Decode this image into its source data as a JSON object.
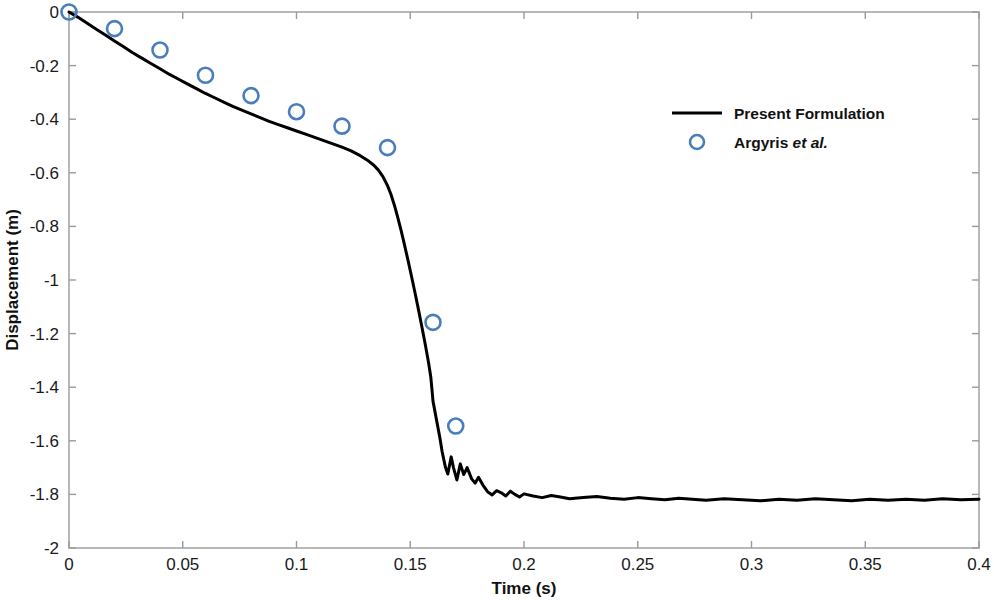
{
  "chart_data": {
    "type": "line",
    "title": "",
    "xlabel": "Time (s)",
    "ylabel": "Displacement (m)",
    "xlim": [
      0,
      0.4
    ],
    "ylim": [
      -2,
      0
    ],
    "grid": false,
    "legend_position": "upper right",
    "xticks": [
      0,
      0.05,
      0.1,
      0.15,
      0.2,
      0.25,
      0.3,
      0.35,
      0.4
    ],
    "xticklabels": [
      "0",
      "0.05",
      "0.1",
      "0.15",
      "0.2",
      "0.25",
      "0.3",
      "0.35",
      "0.4"
    ],
    "yticks": [
      0,
      -0.2,
      -0.4,
      -0.6,
      -0.8,
      -1,
      -1.2,
      -1.4,
      -1.6,
      -1.8,
      -2
    ],
    "yticklabels": [
      "0",
      "-0.2",
      "-0.4",
      "-0.6",
      "-0.8",
      "-1",
      "-1.2",
      "-1.4",
      "-1.6",
      "-1.8",
      "-2"
    ],
    "series": [
      {
        "name": "Present Formulation",
        "style": "line",
        "color": "#000000",
        "linewidth": 3,
        "x": [
          0,
          0.004,
          0.008,
          0.012,
          0.016,
          0.02,
          0.024,
          0.028,
          0.032,
          0.036,
          0.04,
          0.044,
          0.048,
          0.052,
          0.056,
          0.06,
          0.064,
          0.068,
          0.072,
          0.076,
          0.08,
          0.084,
          0.088,
          0.092,
          0.096,
          0.1,
          0.104,
          0.108,
          0.112,
          0.116,
          0.12,
          0.124,
          0.128,
          0.131,
          0.134,
          0.136,
          0.138,
          0.14,
          0.1415,
          0.143,
          0.1445,
          0.146,
          0.1475,
          0.149,
          0.1505,
          0.152,
          0.1535,
          0.155,
          0.1565,
          0.158,
          0.159,
          0.1595,
          0.16,
          0.1615,
          0.163,
          0.164,
          0.1655,
          0.1665,
          0.168,
          0.169,
          0.1705,
          0.172,
          0.1735,
          0.175,
          0.177,
          0.1785,
          0.18,
          0.182,
          0.184,
          0.186,
          0.188,
          0.19,
          0.192,
          0.194,
          0.196,
          0.198,
          0.2,
          0.204,
          0.208,
          0.212,
          0.216,
          0.22,
          0.226,
          0.232,
          0.238,
          0.244,
          0.25,
          0.256,
          0.262,
          0.268,
          0.274,
          0.28,
          0.288,
          0.296,
          0.304,
          0.312,
          0.32,
          0.328,
          0.336,
          0.344,
          0.352,
          0.36,
          0.368,
          0.376,
          0.384,
          0.392,
          0.4
        ],
        "y": [
          0,
          -0.02,
          -0.042,
          -0.064,
          -0.086,
          -0.108,
          -0.13,
          -0.152,
          -0.172,
          -0.192,
          -0.212,
          -0.232,
          -0.25,
          -0.268,
          -0.286,
          -0.304,
          -0.32,
          -0.336,
          -0.352,
          -0.366,
          -0.38,
          -0.394,
          -0.408,
          -0.42,
          -0.432,
          -0.444,
          -0.456,
          -0.468,
          -0.48,
          -0.492,
          -0.504,
          -0.518,
          -0.536,
          -0.552,
          -0.572,
          -0.59,
          -0.614,
          -0.648,
          -0.68,
          -0.72,
          -0.766,
          -0.816,
          -0.87,
          -0.926,
          -0.984,
          -1.044,
          -1.106,
          -1.17,
          -1.236,
          -1.306,
          -1.36,
          -1.404,
          -1.452,
          -1.52,
          -1.588,
          -1.64,
          -1.7,
          -1.724,
          -1.66,
          -1.7,
          -1.746,
          -1.686,
          -1.726,
          -1.7,
          -1.742,
          -1.758,
          -1.736,
          -1.766,
          -1.79,
          -1.802,
          -1.786,
          -1.794,
          -1.806,
          -1.788,
          -1.8,
          -1.81,
          -1.798,
          -1.806,
          -1.812,
          -1.804,
          -1.81,
          -1.816,
          -1.812,
          -1.808,
          -1.814,
          -1.818,
          -1.812,
          -1.816,
          -1.82,
          -1.814,
          -1.818,
          -1.822,
          -1.816,
          -1.82,
          -1.824,
          -1.818,
          -1.822,
          -1.816,
          -1.82,
          -1.824,
          -1.818,
          -1.822,
          -1.818,
          -1.822,
          -1.816,
          -1.82,
          -1.818
        ]
      },
      {
        "name": "Argyris et al.",
        "style": "markers",
        "marker": "circle-open",
        "color": "#4a7ebb",
        "x": [
          0,
          0.02,
          0.04,
          0.06,
          0.08,
          0.1,
          0.12,
          0.14,
          0.16,
          0.17
        ],
        "y": [
          0,
          -0.062,
          -0.142,
          -0.236,
          -0.312,
          -0.372,
          -0.426,
          -0.506,
          -1.158,
          -1.545
        ]
      }
    ]
  },
  "legend": {
    "entries": [
      {
        "label": "Present Formulation",
        "label_plain": "Present Formulation",
        "label_italic": "",
        "type": "line"
      },
      {
        "label": "Argyris et al.",
        "label_plain": "Argyris ",
        "label_italic": "et al.",
        "type": "marker"
      }
    ]
  },
  "colors": {
    "line": "#000000",
    "marker": "#4a7ebb",
    "axis": "#9a9a9a",
    "text": "#111111",
    "background": "#ffffff"
  }
}
